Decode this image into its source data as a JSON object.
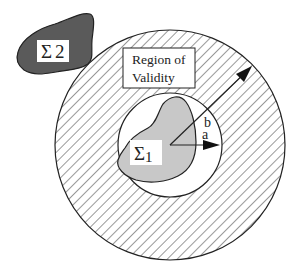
{
  "diagram": {
    "labels": {
      "region_line1": "Region of",
      "region_line2": "Validity",
      "sigma1": "Σ",
      "sigma1_sub": "1",
      "sigma2": "Σ",
      "sigma2_sub": "2",
      "radius_a": "a",
      "radius_b": "b"
    },
    "colors": {
      "stroke": "#222222",
      "hatch": "#333333",
      "sigma1_fill": "#c8c8c8",
      "sigma2_fill": "#5a5a5a",
      "background": "#ffffff"
    },
    "geometry": {
      "center": [
        170,
        145
      ],
      "inner_radius_a": 52,
      "outer_radius_b": 115
    }
  }
}
